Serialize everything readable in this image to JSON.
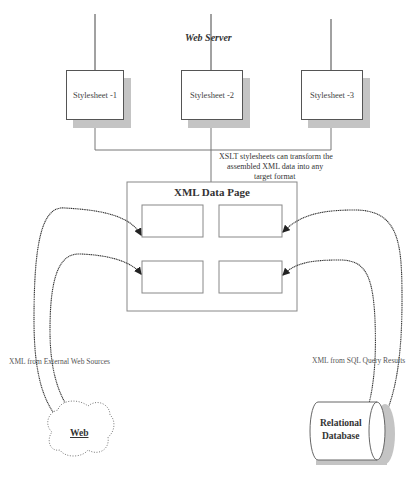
{
  "diagram": {
    "title": "Web Server",
    "stylesheets": [
      {
        "label": "Stylesheet  -1"
      },
      {
        "label": "Stylesheet  -2"
      },
      {
        "label": "Stylesheet  -3"
      }
    ],
    "xslt_note": [
      "XSLT stylesheets can transform the",
      "assembled XML data into any",
      "target format"
    ],
    "data_page": {
      "title": "XML Data Page",
      "slots": 4
    },
    "left_source": {
      "label": "Web",
      "edge_label": "XML from External Web Sources"
    },
    "right_source": {
      "label_line1": "Relational",
      "label_line2": "Database",
      "edge_label": "XML from SQL Query Results"
    },
    "colors": {
      "line": "#444444",
      "shadow": "#c4c4c4",
      "box_border": "#777777"
    }
  }
}
